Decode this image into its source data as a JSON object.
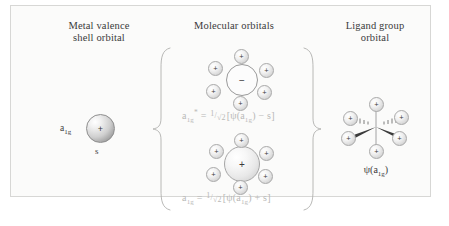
{
  "figure": {
    "columns": {
      "metal": {
        "title_line1": "Metal valence",
        "title_line2": "shell orbital"
      },
      "molecular": {
        "title_line1": "Molecular orbitals",
        "title_line2": ""
      },
      "ligand": {
        "title_line1": "Ligand group",
        "title_line2": "orbital"
      }
    },
    "metal_orbital": {
      "symmetry_label": "a",
      "symmetry_sub": "1g",
      "sign": "+",
      "orbital_name": "s"
    },
    "antibonding_mo": {
      "core_sign": "−",
      "ligand_sign": "+",
      "ligand_count": 6,
      "equation": {
        "lhs": "a",
        "lhs_sub": "1g",
        "lhs_sup": "*",
        "equals": "=",
        "frac_num": "1",
        "frac_den": "√2",
        "rhs": "[ψ(a",
        "rhs_sub": "1g",
        "rhs_mid": ") − s]",
        "full_text": "a1g* = 1/√2[ψ(a1g) − s]"
      }
    },
    "bonding_mo": {
      "core_sign": "+",
      "ligand_sign": "+",
      "ligand_count": 6,
      "equation": {
        "lhs": "a",
        "lhs_sub": "1g",
        "lhs_sup": "",
        "equals": "=",
        "frac_num": "1",
        "frac_den": "√2",
        "rhs": "[ψ(a",
        "rhs_sub": "1g",
        "rhs_mid": ") + s]",
        "full_text": "a1g = 1/√2[ψ(a1g) + s]"
      }
    },
    "ligand_group_orbital": {
      "sign": "+",
      "ligand_count": 6,
      "label_psi": "ψ(a",
      "label_sub": "1g",
      "label_close": ")"
    },
    "colors": {
      "background": "#ffffff",
      "panel": "#fbfbfa",
      "border": "#d7d7d5",
      "text": "#3a3a3a",
      "equation_text": "#b9b9b7",
      "sphere_outline": "#a9a9a9"
    }
  }
}
